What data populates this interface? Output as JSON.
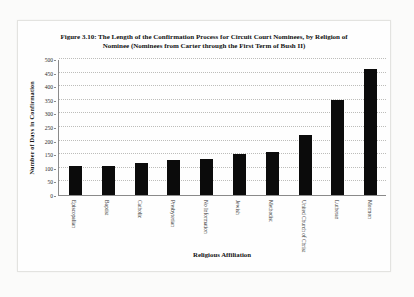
{
  "figure": {
    "label": "Figure 3.10"
  },
  "chart_data": {
    "type": "bar",
    "title": "Figure 3.10: The Length of the Confirmation Process for Circuit Court Nominees, by Religion of Nominee (Nominees from Carter through the First Term of Bush II)",
    "categories": [
      "Episcopalian",
      "Baptist",
      "Catholic",
      "Presbyterian",
      "No Information",
      "Jewish",
      "Methodist",
      "United Church of Christ",
      "Lutheran",
      "Mormon"
    ],
    "values": [
      105,
      106,
      117,
      130,
      132,
      150,
      158,
      222,
      350,
      465
    ],
    "xlabel": "Religious Affiliation",
    "ylabel": "Number of Days in Confirmation",
    "ylim": [
      0,
      500
    ],
    "ytick_step": 50,
    "ytick_labels": [
      "0",
      "50",
      "100",
      "150",
      "200",
      "250",
      "300",
      "350",
      "400",
      "450",
      "500"
    ],
    "grid": true,
    "legend": "none",
    "bar_color": "#0b0b0b"
  }
}
